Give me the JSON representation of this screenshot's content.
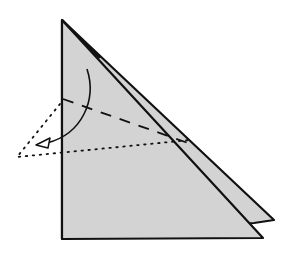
{
  "diagram": {
    "type": "origami-fold-step",
    "colors": {
      "paper": "#d3d3d3",
      "line": "#111111",
      "background": "#ffffff"
    },
    "shapes": {
      "back_flap": [
        [
          62,
          20
        ],
        [
          274,
          220
        ],
        [
          254,
          222
        ]
      ],
      "front_layer": [
        [
          62,
          20
        ],
        [
          263,
          238
        ],
        [
          62,
          239
        ]
      ],
      "valley_fold_line": [
        [
          63,
          99
        ],
        [
          188,
          143
        ]
      ],
      "result_outline": [
        [
          60,
          104
        ],
        [
          17,
          157
        ],
        [
          190,
          140
        ]
      ],
      "arrow_path": "M 88 69 C 100 100, 80 138, 38 143"
    }
  }
}
